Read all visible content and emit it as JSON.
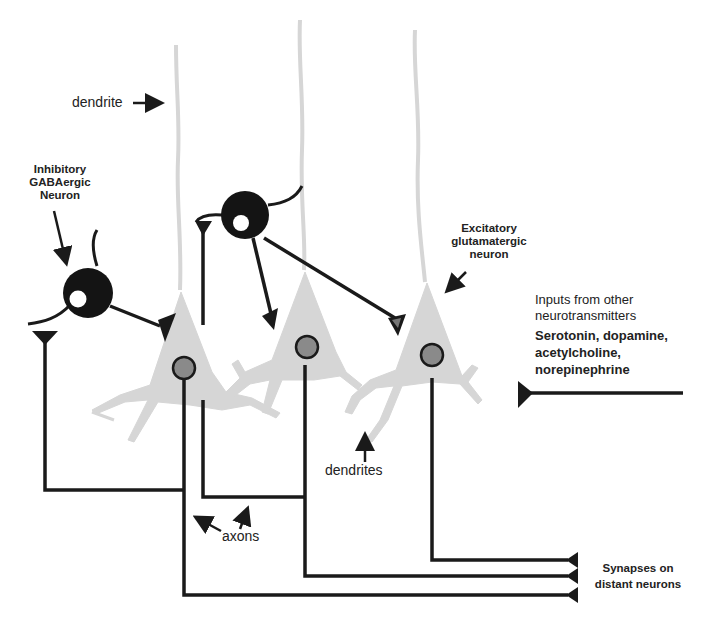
{
  "labels": {
    "dendrite": "dendrite",
    "inhibitory_line1": "Inhibitory",
    "inhibitory_line2": "GABAergic",
    "inhibitory_line3": "Neuron",
    "excitatory_line1": "Excitatory",
    "excitatory_line2": "glutamatergic",
    "excitatory_line3": "neuron",
    "inputs_line1": "Inputs from other",
    "inputs_line2": "neurotransmitters",
    "neuromodulators_line1": "Serotonin, dopamine,",
    "neuromodulators_line2": "acetylcholine,",
    "neuromodulators_line3": "norepinephrine",
    "dendrites": "dendrites",
    "axons": "axons",
    "synapses_line1": "Synapses on",
    "synapses_line2": "distant neurons"
  },
  "colors": {
    "background": "#ffffff",
    "line": "#1a1a1a",
    "pyramidal_fill": "#d6d6d6",
    "nucleus_fill": "#8a8a8a",
    "inhibitory_fill": "#141414"
  }
}
